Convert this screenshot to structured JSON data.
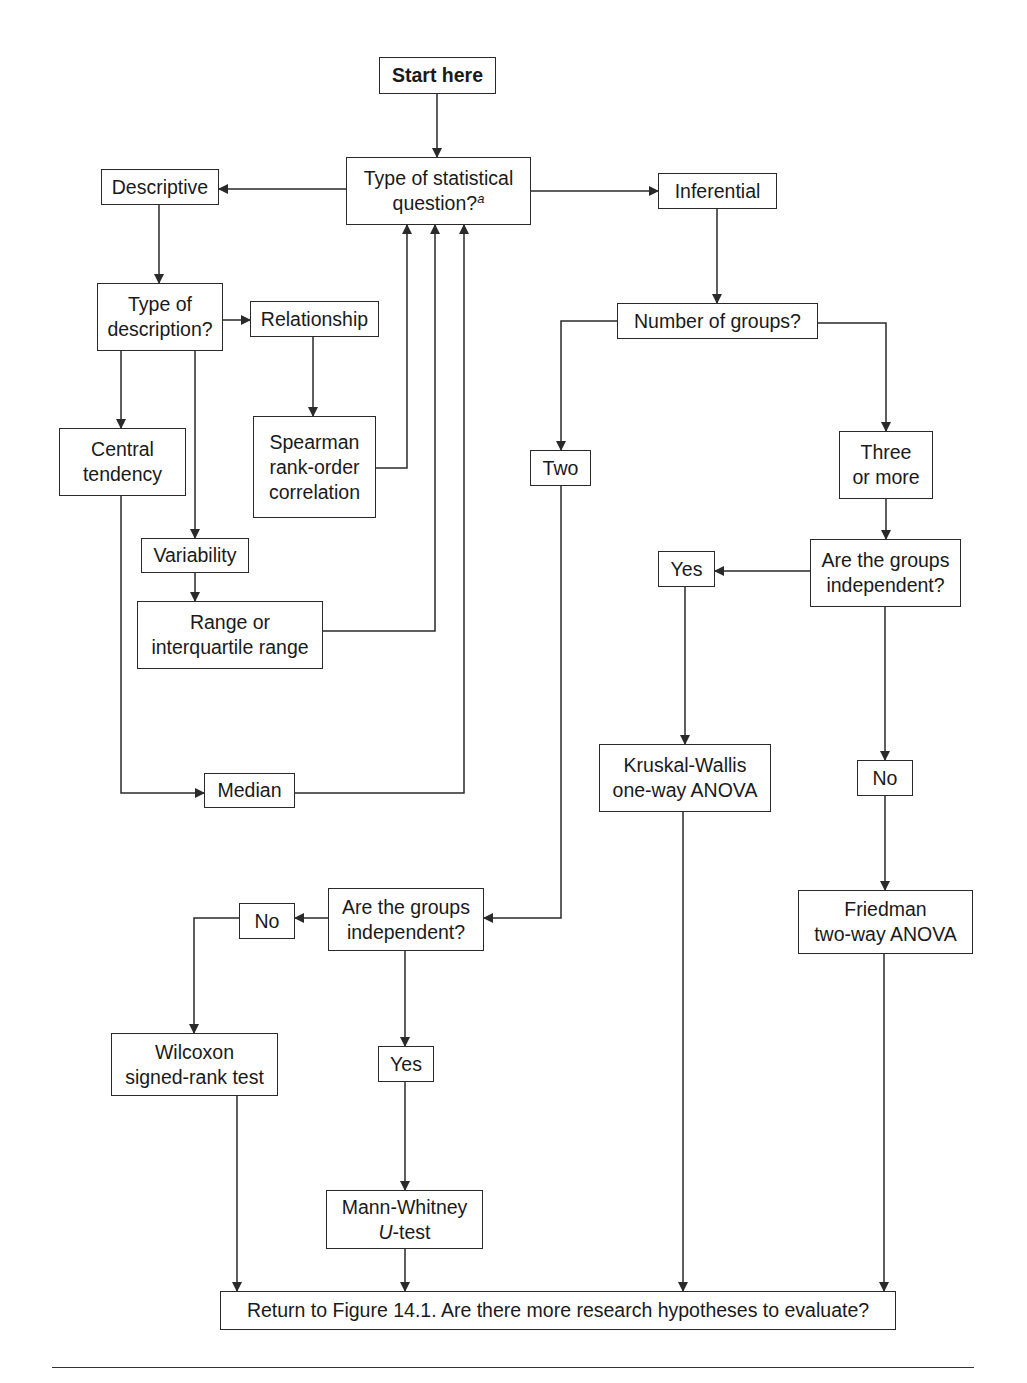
{
  "diagram": {
    "type": "flowchart",
    "colors": {
      "line": "#2a2a2a",
      "background": "#ffffff",
      "text": "#1a1a1a"
    },
    "nodes": [
      {
        "id": "start",
        "label": "Start here",
        "bold": true,
        "x": 379,
        "y": 57,
        "w": 117,
        "h": 37
      },
      {
        "id": "question",
        "label": "Type of statistical\nquestion?",
        "sup": "a",
        "x": 346,
        "y": 157,
        "w": 185,
        "h": 68
      },
      {
        "id": "descriptive",
        "label": "Descriptive",
        "x": 101,
        "y": 169,
        "w": 118,
        "h": 36
      },
      {
        "id": "inferential",
        "label": "Inferential",
        "x": 658,
        "y": 173,
        "w": 119,
        "h": 36
      },
      {
        "id": "type_desc",
        "label": "Type of\ndescription?",
        "x": 97,
        "y": 283,
        "w": 126,
        "h": 68
      },
      {
        "id": "relationship",
        "label": "Relationship",
        "x": 250,
        "y": 301,
        "w": 129,
        "h": 36
      },
      {
        "id": "num_groups",
        "label": "Number of groups?",
        "x": 617,
        "y": 303,
        "w": 201,
        "h": 36
      },
      {
        "id": "central",
        "label": "Central\ntendency",
        "x": 59,
        "y": 428,
        "w": 127,
        "h": 68
      },
      {
        "id": "spearman",
        "label": "Spearman\nrank-order\ncorrelation",
        "x": 253,
        "y": 416,
        "w": 123,
        "h": 102
      },
      {
        "id": "two",
        "label": "Two",
        "x": 530,
        "y": 450,
        "w": 61,
        "h": 36
      },
      {
        "id": "three",
        "label": "Three\nor more",
        "x": 839,
        "y": 431,
        "w": 94,
        "h": 68
      },
      {
        "id": "variability",
        "label": "Variability",
        "x": 141,
        "y": 538,
        "w": 108,
        "h": 35
      },
      {
        "id": "yes_right",
        "label": "Yes",
        "x": 658,
        "y": 551,
        "w": 57,
        "h": 36
      },
      {
        "id": "indep_right",
        "label": "Are the groups\nindependent?",
        "x": 810,
        "y": 539,
        "w": 151,
        "h": 68
      },
      {
        "id": "range",
        "label": "Range or\ninterquartile range",
        "x": 137,
        "y": 601,
        "w": 186,
        "h": 68
      },
      {
        "id": "kruskal",
        "label": "Kruskal-Wallis\none-way ANOVA",
        "x": 599,
        "y": 744,
        "w": 172,
        "h": 68
      },
      {
        "id": "no_right",
        "label": "No",
        "x": 857,
        "y": 760,
        "w": 56,
        "h": 36
      },
      {
        "id": "median",
        "label": "Median",
        "x": 204,
        "y": 773,
        "w": 91,
        "h": 35
      },
      {
        "id": "friedman",
        "label": "Friedman\ntwo-way ANOVA",
        "x": 798,
        "y": 890,
        "w": 175,
        "h": 64
      },
      {
        "id": "no_left",
        "label": "No",
        "x": 239,
        "y": 903,
        "w": 56,
        "h": 36
      },
      {
        "id": "indep_left",
        "label": "Are the groups\nindependent?",
        "x": 328,
        "y": 888,
        "w": 156,
        "h": 63
      },
      {
        "id": "wilcoxon",
        "label": "Wilcoxon\nsigned-rank test",
        "x": 111,
        "y": 1033,
        "w": 167,
        "h": 63
      },
      {
        "id": "yes_left",
        "label": "Yes",
        "x": 378,
        "y": 1046,
        "w": 56,
        "h": 36
      },
      {
        "id": "mann",
        "label": "Mann-Whitney",
        "label_italic_prefix": "U",
        "label_line2": "-test",
        "x": 326,
        "y": 1190,
        "w": 157,
        "h": 59
      },
      {
        "id": "return",
        "label": "Return to Figure 14.1. Are there more research hypotheses to evaluate?",
        "x": 220,
        "y": 1291,
        "w": 676,
        "h": 39
      }
    ],
    "edges": [
      {
        "from": "start",
        "to": "question",
        "points": [
          [
            437,
            94
          ],
          [
            437,
            157
          ]
        ]
      },
      {
        "from": "question",
        "to": "descriptive",
        "points": [
          [
            346,
            189
          ],
          [
            219,
            189
          ]
        ]
      },
      {
        "from": "question",
        "to": "inferential",
        "points": [
          [
            531,
            191
          ],
          [
            658,
            191
          ]
        ]
      },
      {
        "from": "descriptive",
        "to": "type_desc",
        "points": [
          [
            159,
            205
          ],
          [
            159,
            283
          ]
        ]
      },
      {
        "from": "type_desc",
        "to": "relationship",
        "points": [
          [
            223,
            320
          ],
          [
            250,
            320
          ]
        ]
      },
      {
        "from": "relationship",
        "to": "spearman",
        "points": [
          [
            313,
            337
          ],
          [
            313,
            416
          ]
        ]
      },
      {
        "from": "type_desc",
        "to": "central",
        "points": [
          [
            121,
            351
          ],
          [
            121,
            428
          ]
        ]
      },
      {
        "from": "type_desc",
        "to": "variability",
        "points": [
          [
            195,
            351
          ],
          [
            195,
            538
          ]
        ]
      },
      {
        "from": "variability",
        "to": "range",
        "points": [
          [
            195,
            573
          ],
          [
            195,
            601
          ]
        ]
      },
      {
        "from": "spearman",
        "to": "question",
        "points": [
          [
            376,
            468
          ],
          [
            407,
            468
          ],
          [
            407,
            225
          ]
        ]
      },
      {
        "from": "range",
        "to": "question",
        "points": [
          [
            323,
            631
          ],
          [
            435,
            631
          ],
          [
            435,
            225
          ]
        ]
      },
      {
        "from": "central",
        "to": "median",
        "points": [
          [
            121,
            496
          ],
          [
            121,
            793
          ],
          [
            204,
            793
          ]
        ]
      },
      {
        "from": "median",
        "to": "question",
        "points": [
          [
            295,
            793
          ],
          [
            464,
            793
          ],
          [
            464,
            225
          ]
        ]
      },
      {
        "from": "inferential",
        "to": "num_groups",
        "points": [
          [
            717,
            209
          ],
          [
            717,
            303
          ]
        ]
      },
      {
        "from": "num_groups",
        "to": "two",
        "points": [
          [
            617,
            321
          ],
          [
            561,
            321
          ],
          [
            561,
            450
          ]
        ]
      },
      {
        "from": "num_groups",
        "to": "three",
        "points": [
          [
            818,
            323
          ],
          [
            886,
            323
          ],
          [
            886,
            431
          ]
        ]
      },
      {
        "from": "three",
        "to": "indep_right",
        "points": [
          [
            886,
            499
          ],
          [
            886,
            539
          ]
        ]
      },
      {
        "from": "indep_right",
        "to": "yes_right",
        "points": [
          [
            810,
            571
          ],
          [
            715,
            571
          ]
        ]
      },
      {
        "from": "yes_right",
        "to": "kruskal",
        "points": [
          [
            685,
            587
          ],
          [
            685,
            744
          ]
        ]
      },
      {
        "from": "indep_right",
        "to": "no_right",
        "points": [
          [
            885,
            607
          ],
          [
            885,
            760
          ]
        ]
      },
      {
        "from": "no_right",
        "to": "friedman",
        "points": [
          [
            885,
            796
          ],
          [
            885,
            890
          ]
        ]
      },
      {
        "from": "two",
        "to": "indep_left",
        "points": [
          [
            561,
            486
          ],
          [
            561,
            918
          ],
          [
            484,
            918
          ]
        ]
      },
      {
        "from": "indep_left",
        "to": "no_left",
        "points": [
          [
            328,
            918
          ],
          [
            295,
            918
          ]
        ]
      },
      {
        "from": "no_left",
        "to": "wilcoxon",
        "points": [
          [
            239,
            918
          ],
          [
            194,
            918
          ],
          [
            194,
            1033
          ]
        ]
      },
      {
        "from": "indep_left",
        "to": "yes_left",
        "points": [
          [
            405,
            951
          ],
          [
            405,
            1046
          ]
        ]
      },
      {
        "from": "yes_left",
        "to": "mann",
        "points": [
          [
            405,
            1082
          ],
          [
            405,
            1190
          ]
        ]
      },
      {
        "from": "wilcoxon",
        "to": "return",
        "points": [
          [
            237,
            1096
          ],
          [
            237,
            1291
          ]
        ]
      },
      {
        "from": "mann",
        "to": "return",
        "points": [
          [
            405,
            1249
          ],
          [
            405,
            1291
          ]
        ]
      },
      {
        "from": "kruskal",
        "to": "return",
        "points": [
          [
            683,
            812
          ],
          [
            683,
            1291
          ]
        ]
      },
      {
        "from": "friedman",
        "to": "return",
        "points": [
          [
            884,
            954
          ],
          [
            884,
            1291
          ]
        ]
      }
    ]
  }
}
